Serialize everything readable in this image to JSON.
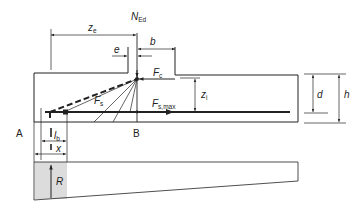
{
  "diagram": {
    "type": "strut-and-tie model of beam end near support",
    "labels": {
      "N_Ed": {
        "main": "N",
        "sub": "Ed"
      },
      "z_e": {
        "main": "z",
        "sub": "e"
      },
      "e": {
        "main": "e"
      },
      "b": {
        "main": "b"
      },
      "F_c": {
        "main": "F",
        "sub": "c"
      },
      "F_s": {
        "main": "F",
        "sub": "s"
      },
      "F_s_max": {
        "main": "F",
        "sub": "s,max"
      },
      "z_i": {
        "main": "z",
        "sub": "i"
      },
      "d": {
        "main": "d"
      },
      "h": {
        "main": "h"
      },
      "A": {
        "main": "A"
      },
      "B": {
        "main": "B"
      },
      "l_b": {
        "main": "l",
        "sub": "b"
      },
      "x": {
        "main": "x"
      },
      "R": {
        "main": "R"
      }
    },
    "colors": {
      "line": "#222222",
      "hatch": "#9a9a9a",
      "background": "#ffffff"
    }
  }
}
